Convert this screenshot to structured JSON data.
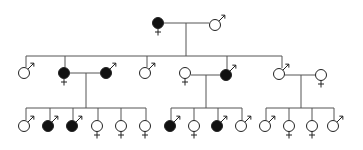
{
  "diagram": {
    "type": "pedigree",
    "colors": {
      "affected": "#111111",
      "unaffected": "#ffffff",
      "line": "#555555",
      "outline": "#222222"
    },
    "legend_symbols": {
      "male": "♂",
      "female": "♀"
    },
    "individuals": [
      {
        "id": "I-1",
        "gen": 1,
        "sex": "female",
        "affected": true,
        "x": 158,
        "y": 23
      },
      {
        "id": "I-2",
        "gen": 1,
        "sex": "male",
        "affected": false,
        "x": 215,
        "y": 25
      },
      {
        "id": "II-1",
        "gen": 2,
        "sex": "male",
        "affected": false,
        "x": 24,
        "y": 73
      },
      {
        "id": "II-2",
        "gen": 2,
        "sex": "female",
        "affected": true,
        "x": 64,
        "y": 73
      },
      {
        "id": "II-3",
        "gen": 2,
        "sex": "male",
        "affected": true,
        "x": 106,
        "y": 73
      },
      {
        "id": "II-4",
        "gen": 2,
        "sex": "male",
        "affected": false,
        "x": 145,
        "y": 73
      },
      {
        "id": "II-5",
        "gen": 2,
        "sex": "female",
        "affected": false,
        "x": 185,
        "y": 73
      },
      {
        "id": "II-6",
        "gen": 2,
        "sex": "male",
        "affected": true,
        "x": 226,
        "y": 75
      },
      {
        "id": "II-7",
        "gen": 2,
        "sex": "male",
        "affected": false,
        "x": 279,
        "y": 74
      },
      {
        "id": "II-8",
        "gen": 2,
        "sex": "female",
        "affected": false,
        "x": 321,
        "y": 75
      },
      {
        "id": "III-1",
        "gen": 3,
        "sex": "male",
        "affected": false,
        "x": 24,
        "y": 126
      },
      {
        "id": "III-2",
        "gen": 3,
        "sex": "male",
        "affected": true,
        "x": 48,
        "y": 126
      },
      {
        "id": "III-3",
        "gen": 3,
        "sex": "male",
        "affected": true,
        "x": 72,
        "y": 126
      },
      {
        "id": "III-4",
        "gen": 3,
        "sex": "female",
        "affected": false,
        "x": 97,
        "y": 126
      },
      {
        "id": "III-5",
        "gen": 3,
        "sex": "female",
        "affected": false,
        "x": 121,
        "y": 126
      },
      {
        "id": "III-6",
        "gen": 3,
        "sex": "female",
        "affected": false,
        "x": 145,
        "y": 126
      },
      {
        "id": "III-7",
        "gen": 3,
        "sex": "male",
        "affected": true,
        "x": 170,
        "y": 126
      },
      {
        "id": "III-8",
        "gen": 3,
        "sex": "female",
        "affected": false,
        "x": 194,
        "y": 126
      },
      {
        "id": "III-9",
        "gen": 3,
        "sex": "male",
        "affected": true,
        "x": 217,
        "y": 126
      },
      {
        "id": "III-10",
        "gen": 3,
        "sex": "male",
        "affected": false,
        "x": 241,
        "y": 126
      },
      {
        "id": "III-11",
        "gen": 3,
        "sex": "male",
        "affected": false,
        "x": 265,
        "y": 126
      },
      {
        "id": "III-12",
        "gen": 3,
        "sex": "female",
        "affected": false,
        "x": 289,
        "y": 126
      },
      {
        "id": "III-13",
        "gen": 3,
        "sex": "female",
        "affected": false,
        "x": 312,
        "y": 126
      },
      {
        "id": "III-14",
        "gen": 3,
        "sex": "male",
        "affected": false,
        "x": 333,
        "y": 126
      }
    ],
    "lines": [
      {
        "name": "couple-I",
        "x1": 164,
        "y1": 23,
        "x2": 209,
        "y2": 23
      },
      {
        "name": "drop-I",
        "x1": 186,
        "y1": 23,
        "x2": 186,
        "y2": 56
      },
      {
        "name": "sibship-II",
        "x1": 26,
        "y1": 56,
        "x2": 282,
        "y2": 56
      },
      {
        "name": "tick-II-1",
        "x1": 26,
        "y1": 56,
        "x2": 26,
        "y2": 67
      },
      {
        "name": "tick-II-2",
        "x1": 65,
        "y1": 56,
        "x2": 65,
        "y2": 67
      },
      {
        "name": "tick-II-4",
        "x1": 147,
        "y1": 56,
        "x2": 147,
        "y2": 67
      },
      {
        "name": "tick-II-6",
        "x1": 227,
        "y1": 56,
        "x2": 227,
        "y2": 69
      },
      {
        "name": "tick-II-7",
        "x1": 282,
        "y1": 56,
        "x2": 282,
        "y2": 68
      },
      {
        "name": "couple-A",
        "x1": 70,
        "y1": 73,
        "x2": 100,
        "y2": 73
      },
      {
        "name": "drop-A",
        "x1": 86,
        "y1": 73,
        "x2": 86,
        "y2": 108
      },
      {
        "name": "sibship-A",
        "x1": 26,
        "y1": 108,
        "x2": 146,
        "y2": 108
      },
      {
        "name": "t-III-1",
        "x1": 26,
        "y1": 108,
        "x2": 26,
        "y2": 120
      },
      {
        "name": "t-III-2",
        "x1": 50,
        "y1": 108,
        "x2": 50,
        "y2": 120
      },
      {
        "name": "t-III-3",
        "x1": 73,
        "y1": 108,
        "x2": 73,
        "y2": 120
      },
      {
        "name": "t-III-4",
        "x1": 98,
        "y1": 108,
        "x2": 98,
        "y2": 120
      },
      {
        "name": "t-III-5",
        "x1": 121,
        "y1": 108,
        "x2": 121,
        "y2": 120
      },
      {
        "name": "t-III-6",
        "x1": 146,
        "y1": 108,
        "x2": 146,
        "y2": 120
      },
      {
        "name": "couple-B",
        "x1": 191,
        "y1": 75,
        "x2": 220,
        "y2": 75
      },
      {
        "name": "drop-B",
        "x1": 206,
        "y1": 75,
        "x2": 206,
        "y2": 108
      },
      {
        "name": "sibship-B",
        "x1": 171,
        "y1": 108,
        "x2": 242,
        "y2": 108
      },
      {
        "name": "t-III-7",
        "x1": 171,
        "y1": 108,
        "x2": 171,
        "y2": 120
      },
      {
        "name": "t-III-8",
        "x1": 194,
        "y1": 108,
        "x2": 194,
        "y2": 120
      },
      {
        "name": "t-III-9",
        "x1": 218,
        "y1": 108,
        "x2": 218,
        "y2": 120
      },
      {
        "name": "t-III-10",
        "x1": 242,
        "y1": 108,
        "x2": 242,
        "y2": 120
      },
      {
        "name": "couple-C",
        "x1": 285,
        "y1": 75,
        "x2": 315,
        "y2": 75
      },
      {
        "name": "drop-C",
        "x1": 301,
        "y1": 75,
        "x2": 301,
        "y2": 108
      },
      {
        "name": "sibship-C",
        "x1": 266,
        "y1": 108,
        "x2": 334,
        "y2": 108
      },
      {
        "name": "t-III-11",
        "x1": 266,
        "y1": 108,
        "x2": 266,
        "y2": 120
      },
      {
        "name": "t-III-12",
        "x1": 289,
        "y1": 108,
        "x2": 289,
        "y2": 120
      },
      {
        "name": "t-III-13",
        "x1": 312,
        "y1": 108,
        "x2": 312,
        "y2": 120
      },
      {
        "name": "t-III-14",
        "x1": 334,
        "y1": 108,
        "x2": 334,
        "y2": 120
      }
    ]
  }
}
